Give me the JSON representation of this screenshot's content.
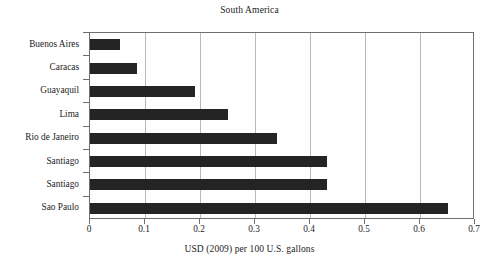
{
  "chart_data": {
    "type": "bar",
    "orientation": "horizontal",
    "title": "South America",
    "xlabel": "USD (2009) per 100 U.S. gallons",
    "ylabel": "",
    "xlim": [
      0,
      0.7
    ],
    "xticks": [
      "0",
      "0.1",
      "0.2",
      "0.3",
      "0.4",
      "0.5",
      "0.6",
      "0.7"
    ],
    "xtick_values": [
      0,
      0.1,
      0.2,
      0.3,
      0.4,
      0.5,
      0.6,
      0.7
    ],
    "grid": "vertical",
    "legend": "none",
    "categories": [
      "Buenos Aires",
      "Caracas",
      "Guayaquil",
      "Lima",
      "Rio de Janeiro",
      "Santiago",
      "Santiago",
      "Sao Paulo"
    ],
    "values": [
      0.055,
      0.085,
      0.19,
      0.25,
      0.34,
      0.43,
      0.43,
      0.65
    ],
    "bar_color": "#242424",
    "grid_color": "#b9b9b9",
    "axis_color": "#6f6f6f",
    "background_color": "#ffffff"
  }
}
